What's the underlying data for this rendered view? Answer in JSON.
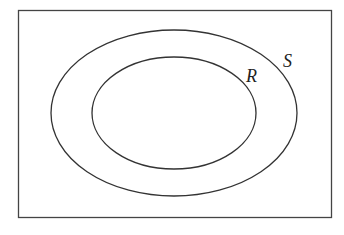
{
  "diagram": {
    "type": "venn",
    "universe": {
      "label": ""
    },
    "sets": [
      {
        "name": "S",
        "label": "S",
        "contains": [
          "R"
        ]
      },
      {
        "name": "R",
        "label": "R",
        "subset_of": "S"
      }
    ],
    "colors": {
      "stroke": "#333333",
      "background": "#ffffff",
      "text": "#222222"
    }
  }
}
